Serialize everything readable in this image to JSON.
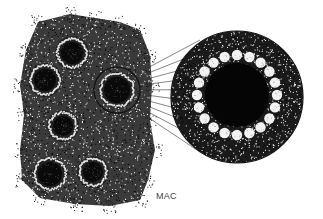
{
  "figure": {
    "label": "MAC",
    "label_pos": {
      "x": 156,
      "y": 191
    },
    "colors": {
      "ink": "#111111",
      "paper": "#ffffff",
      "bacilli": "#f2f2f2",
      "line": "#333333",
      "label": "#444444"
    }
  },
  "cluster": {
    "outline": [
      [
        38,
        22
      ],
      [
        70,
        14
      ],
      [
        95,
        18
      ],
      [
        120,
        22
      ],
      [
        140,
        30
      ],
      [
        150,
        55
      ],
      [
        152,
        85
      ],
      [
        150,
        120
      ],
      [
        155,
        150
      ],
      [
        148,
        180
      ],
      [
        140,
        200
      ],
      [
        110,
        206
      ],
      [
        75,
        204
      ],
      [
        40,
        198
      ],
      [
        22,
        180
      ],
      [
        20,
        150
      ],
      [
        24,
        115
      ],
      [
        20,
        85
      ],
      [
        26,
        50
      ]
    ],
    "cells": [
      {
        "name": "cell-top",
        "cx": 72,
        "cy": 53,
        "r": 11,
        "rim": 17
      },
      {
        "name": "cell-left",
        "cx": 45,
        "cy": 80,
        "r": 11,
        "rim": 17
      },
      {
        "name": "cell-middle",
        "cx": 63,
        "cy": 126,
        "r": 10,
        "rim": 16
      },
      {
        "name": "cell-bottom-left",
        "cx": 50,
        "cy": 174,
        "r": 12,
        "rim": 17
      },
      {
        "name": "cell-bottom-right",
        "cx": 93,
        "cy": 172,
        "r": 10,
        "rim": 16
      }
    ],
    "source_cell": {
      "cx": 117,
      "cy": 90,
      "r": 13,
      "rim": 18,
      "outer": 23
    }
  },
  "magnified": {
    "cx": 237,
    "cy": 97,
    "r": 66,
    "core_r": 32,
    "ring_r": 40,
    "bacilli_count": 20,
    "bacillus_r": 5.2
  },
  "connectors": {
    "count": 10,
    "from_x": 140,
    "from_y_start": 72,
    "from_y_end": 112,
    "to_x": 200,
    "to_y_start": 40,
    "to_y_end": 152
  }
}
